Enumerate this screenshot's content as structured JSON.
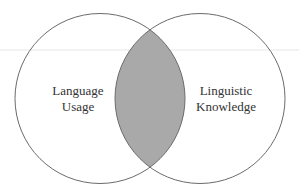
{
  "diagram": {
    "type": "venn",
    "sets": [
      {
        "label_line1": "Language",
        "label_line2": "Usage"
      },
      {
        "label_line1": "Linguistic",
        "label_line2": "Knowledge"
      }
    ],
    "colors": {
      "stroke": "#6b6b6b",
      "intersection_fill": "#a9a9a9",
      "background": "#ffffff",
      "guide_line": "#e6e6e6"
    }
  }
}
